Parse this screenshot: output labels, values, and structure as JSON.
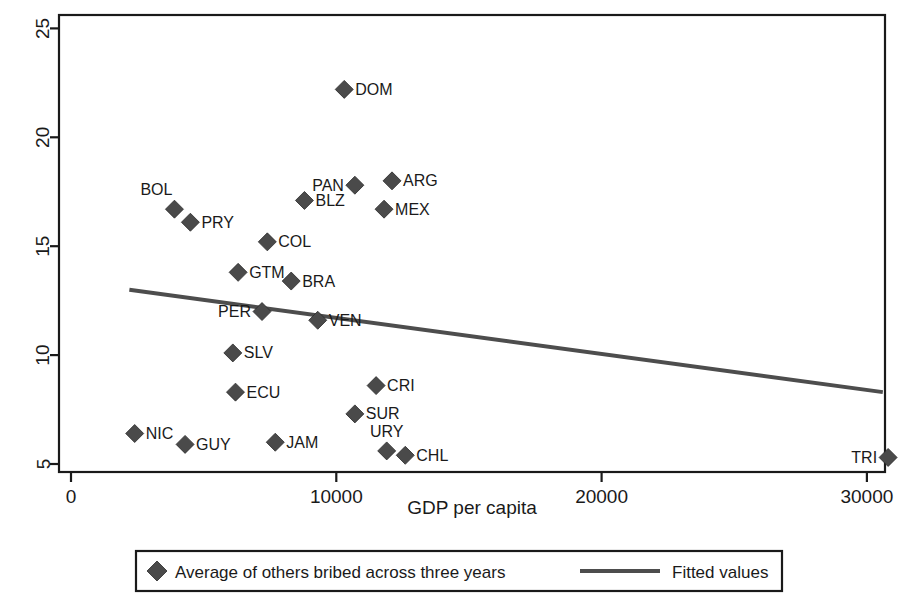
{
  "chart_data": {
    "type": "scatter",
    "title": "",
    "xlabel": "GDP per capita",
    "ylabel": "",
    "xlim": [
      0,
      31500
    ],
    "ylim": [
      4.2,
      25.6
    ],
    "xticks": [
      0,
      10000,
      20000,
      30000
    ],
    "xtick_labels": [
      "0",
      "10000",
      "20000",
      "30000"
    ],
    "yticks": [
      5,
      10,
      15,
      20,
      25
    ],
    "ytick_labels": [
      "5",
      "10",
      "15",
      "20",
      "25"
    ],
    "grid": false,
    "marker_color": "#4a4a4a",
    "line_color": "#4d4d4d",
    "legend": {
      "position": "bottom",
      "entries": [
        {
          "label": "Average of others bribed across three years",
          "marker": "diamond"
        },
        {
          "label": "Fitted values",
          "marker": "line"
        }
      ]
    },
    "points": [
      {
        "label": "DOM",
        "x": 10300,
        "y": 22.2,
        "label_side": "right"
      },
      {
        "label": "ARG",
        "x": 12100,
        "y": 18.0,
        "label_side": "right"
      },
      {
        "label": "PAN",
        "x": 10700,
        "y": 17.8,
        "label_side": "left"
      },
      {
        "label": "BLZ",
        "x": 8800,
        "y": 17.1,
        "label_side": "right"
      },
      {
        "label": "BOL",
        "x": 3900,
        "y": 16.7,
        "label_side": "above-left"
      },
      {
        "label": "MEX",
        "x": 11800,
        "y": 16.7,
        "label_side": "right"
      },
      {
        "label": "PRY",
        "x": 4500,
        "y": 16.1,
        "label_side": "right"
      },
      {
        "label": "COL",
        "x": 7400,
        "y": 15.2,
        "label_side": "right"
      },
      {
        "label": "GTM",
        "x": 6300,
        "y": 13.8,
        "label_side": "right"
      },
      {
        "label": "BRA",
        "x": 8300,
        "y": 13.4,
        "label_side": "right"
      },
      {
        "label": "PER",
        "x": 7200,
        "y": 12.0,
        "label_side": "left"
      },
      {
        "label": "VEN",
        "x": 9300,
        "y": 11.6,
        "label_side": "right"
      },
      {
        "label": "SLV",
        "x": 6100,
        "y": 10.1,
        "label_side": "right"
      },
      {
        "label": "CRI",
        "x": 11500,
        "y": 8.6,
        "label_side": "right"
      },
      {
        "label": "ECU",
        "x": 6200,
        "y": 8.3,
        "label_side": "right"
      },
      {
        "label": "SUR",
        "x": 10700,
        "y": 7.3,
        "label_side": "right"
      },
      {
        "label": "NIC",
        "x": 2400,
        "y": 6.4,
        "label_side": "right"
      },
      {
        "label": "JAM",
        "x": 7700,
        "y": 6.0,
        "label_side": "right"
      },
      {
        "label": "GUY",
        "x": 4300,
        "y": 5.9,
        "label_side": "right"
      },
      {
        "label": "URY",
        "x": 11900,
        "y": 5.6,
        "label_side": "above"
      },
      {
        "label": "CHL",
        "x": 12600,
        "y": 5.4,
        "label_side": "right"
      },
      {
        "label": "TRI",
        "x": 30800,
        "y": 5.3,
        "label_side": "left"
      }
    ],
    "fitted_line": {
      "name": "Fitted values",
      "x": [
        2200,
        30600
      ],
      "y": [
        13.0,
        8.3
      ]
    }
  }
}
